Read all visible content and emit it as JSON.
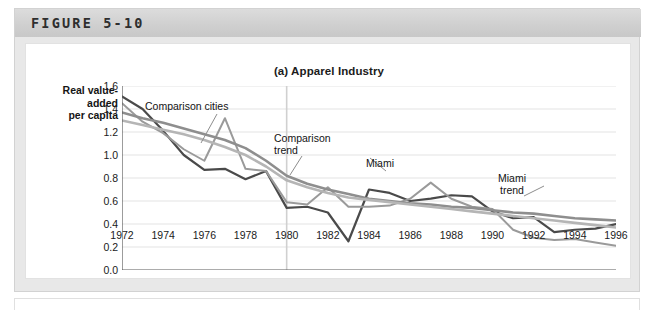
{
  "figure": {
    "number_label": "FIGURE 5-10",
    "panel_title": "(a) Apparel Industry"
  },
  "axes": {
    "y_title_lines": [
      "Real value-",
      "added",
      "per capita"
    ],
    "y_ticks": [
      "0.0",
      "0.2",
      "0.4",
      "0.6",
      "0.8",
      "1.0",
      "1.2",
      "1.4",
      "1.6"
    ],
    "x_ticks": [
      "1972",
      "1974",
      "1976",
      "1978",
      "1980",
      "1982",
      "1984",
      "1986",
      "1988",
      "1990",
      "1992",
      "1994",
      "1996"
    ]
  },
  "annotations": {
    "comparison_cities": "Comparison cities",
    "comparison_trend": "Comparison\ntrend",
    "miami": "Miami",
    "miami_trend": "Miami\ntrend"
  },
  "colors": {
    "miami_line": "#4a4a4a",
    "comparison_line": "#9a9a9a",
    "miami_trend_line": "#8e8e8e",
    "comparison_trend_line": "#b5b5b5",
    "grid": "#e3e3e3",
    "axis": "#5a5a5a",
    "event_line": "#d0d0d0",
    "band_background": "#d4d4d4",
    "panel_background": "#ffffff"
  },
  "chart_data": {
    "type": "line",
    "title": "(a) Apparel Industry",
    "subtitle": "",
    "xlabel": "",
    "ylabel": "Real value-added per capita",
    "xlim": [
      1972,
      1996
    ],
    "ylim": [
      0.0,
      1.6
    ],
    "grid": true,
    "legend": "inline-annotations",
    "event_marker": {
      "x": 1980,
      "label": ""
    },
    "x": [
      1972,
      1973,
      1974,
      1975,
      1976,
      1977,
      1978,
      1979,
      1980,
      1981,
      1982,
      1983,
      1984,
      1985,
      1986,
      1987,
      1988,
      1989,
      1990,
      1991,
      1992,
      1993,
      1994,
      1995,
      1996
    ],
    "series": [
      {
        "name": "Miami",
        "color": "#4a4a4a",
        "values": [
          1.51,
          1.4,
          1.21,
          1.0,
          0.87,
          0.88,
          0.79,
          0.86,
          0.54,
          0.55,
          0.5,
          0.25,
          0.7,
          0.67,
          0.6,
          0.62,
          0.65,
          0.64,
          0.51,
          0.45,
          0.46,
          0.33,
          0.35,
          0.36,
          0.4
        ]
      },
      {
        "name": "Comparison cities",
        "color": "#9a9a9a",
        "values": [
          1.45,
          1.29,
          1.19,
          1.05,
          0.95,
          1.32,
          0.88,
          0.86,
          0.59,
          0.57,
          0.72,
          0.55,
          0.55,
          0.56,
          0.62,
          0.76,
          0.62,
          0.55,
          0.53,
          0.35,
          0.28,
          0.26,
          0.27,
          0.24,
          0.21
        ]
      },
      {
        "name": "Miami trend",
        "color": "#8e8e8e",
        "values": [
          1.37,
          1.32,
          1.28,
          1.23,
          1.18,
          1.13,
          1.06,
          0.95,
          0.82,
          0.75,
          0.7,
          0.66,
          0.62,
          0.6,
          0.58,
          0.57,
          0.55,
          0.54,
          0.52,
          0.5,
          0.49,
          0.47,
          0.45,
          0.44,
          0.43
        ]
      },
      {
        "name": "Comparison trend",
        "color": "#b5b5b5",
        "values": [
          1.3,
          1.26,
          1.22,
          1.18,
          1.13,
          1.07,
          1.0,
          0.9,
          0.78,
          0.72,
          0.67,
          0.63,
          0.61,
          0.59,
          0.57,
          0.55,
          0.53,
          0.51,
          0.49,
          0.47,
          0.45,
          0.43,
          0.41,
          0.39,
          0.37
        ]
      }
    ]
  }
}
